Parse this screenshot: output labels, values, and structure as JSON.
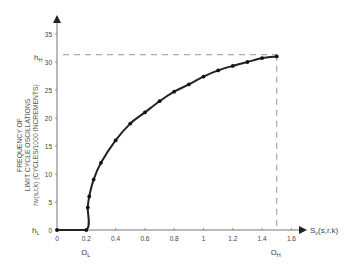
{
  "chart_data": {
    "type": "line",
    "title": "",
    "xlabel": "Sv(s,r,k)",
    "ylabel_lines": [
      "FREQUENCY OF",
      "LIMIT CYCLE OSCILLATIONS",
      "hv(s,r,k) (CYCLES/1000 INCREMENTS)"
    ],
    "x_ticks": [
      "0",
      "0.2",
      "0.4",
      "0.6",
      "0.8",
      "1",
      "1.2",
      "1.4",
      "1.6"
    ],
    "y_ticks": [
      "0",
      "5",
      "10",
      "15",
      "20",
      "25",
      "30",
      "35"
    ],
    "xlim": [
      0,
      1.6
    ],
    "ylim": [
      0,
      35
    ],
    "grid": false,
    "legend": null,
    "annotations": {
      "h_L": {
        "label": "h",
        "sub": "L",
        "y": 0
      },
      "h_H": {
        "label": "h",
        "sub": "H",
        "y": 31.3
      },
      "Omega_L": {
        "label": "Ω",
        "sub": "L",
        "x": 0.2
      },
      "Omega_H": {
        "label": "Ω",
        "sub": "H",
        "x": 1.5
      }
    },
    "series": [
      {
        "name": "hv(s,r,k)",
        "x": [
          0,
          0.2,
          0.21,
          0.22,
          0.25,
          0.3,
          0.4,
          0.5,
          0.6,
          0.7,
          0.8,
          0.9,
          1.0,
          1.1,
          1.2,
          1.3,
          1.4,
          1.5
        ],
        "values": [
          0,
          0,
          4,
          6,
          9,
          12,
          16,
          19,
          21,
          23,
          24.7,
          26,
          27.4,
          28.5,
          29.3,
          30,
          30.7,
          31
        ]
      }
    ]
  }
}
